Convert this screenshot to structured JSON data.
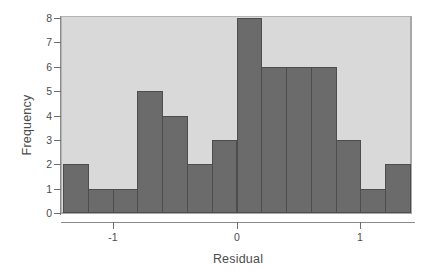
{
  "chart_data": {
    "type": "bar",
    "title": "",
    "subtitle": "",
    "xlabel": "Residual",
    "ylabel": "Frequency",
    "grid": false,
    "legend": null,
    "legend_position": "none",
    "ylim": [
      0,
      8
    ],
    "xlim": [
      -1.4,
      1.4
    ],
    "ytick_labels": [
      "8",
      "7",
      "6",
      "5",
      "4",
      "3",
      "2",
      "1",
      "0"
    ],
    "ytick_values": [
      8,
      7,
      6,
      5,
      4,
      3,
      2,
      1,
      0
    ],
    "xtick_labels": [
      "-1",
      "0",
      "1"
    ],
    "xtick_values": [
      -1,
      0,
      1
    ],
    "bin_width": 0.2,
    "bin_edges": [
      -1.4,
      -1.2,
      -1.0,
      -0.8,
      -0.6,
      -0.4,
      -0.2,
      0.0,
      0.2,
      0.4,
      0.6,
      0.8,
      1.0,
      1.2,
      1.4
    ],
    "categories": [
      "-1.4 to -1.2",
      "-1.2 to -1.0",
      "-1.0 to -0.8",
      "-0.8 to -0.6",
      "-0.6 to -0.4",
      "-0.4 to -0.2",
      "-0.2 to 0.0",
      "0.0 to 0.2",
      "0.2 to 0.4",
      "0.4 to 0.6",
      "0.6 to 0.8",
      "0.8 to 1.0",
      "1.0 to 1.2",
      "1.2 to 1.4"
    ],
    "values": [
      2,
      1,
      1,
      5,
      4,
      2,
      3,
      8,
      6,
      6,
      6,
      3,
      1,
      2
    ],
    "bar_color": "#6b6b6b",
    "bar_edge_color": "#4d4d4d",
    "panel_color": "#d9d9d9",
    "axis_color": "#8a8a8a",
    "text_color": "#4c4c4c"
  }
}
